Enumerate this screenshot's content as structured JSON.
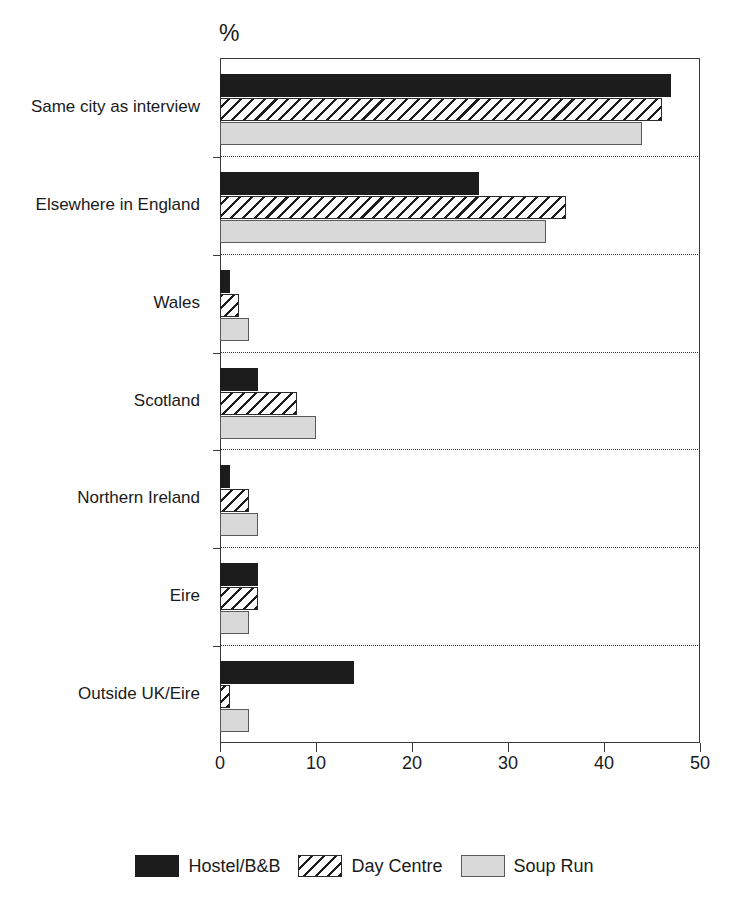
{
  "chart_data": {
    "type": "bar",
    "orientation": "horizontal",
    "title": "",
    "subtitle": "",
    "xlabel": "%",
    "ylabel": "",
    "xlim": [
      0,
      50
    ],
    "xticks": [
      0,
      10,
      20,
      30,
      40,
      50
    ],
    "xtick_labels": [
      "0",
      "10",
      "20",
      "30",
      "40",
      "50"
    ],
    "grid": false,
    "group_separators": "dotted",
    "legend_position": "bottom-center",
    "categories": [
      "Same city as interview",
      "Elsewhere in England",
      "Wales",
      "Scotland",
      "Northern Ireland",
      "Eire",
      "Outside UK/Eire"
    ],
    "series": [
      {
        "name": "Hostel/B&B",
        "key": "hostel",
        "fill": "solid-black",
        "color": "#1c1c1c",
        "values": [
          47,
          27,
          1,
          4,
          1,
          4,
          14
        ]
      },
      {
        "name": "Day Centre",
        "key": "daycentre",
        "fill": "diagonal-hatch",
        "color": "#ffffff",
        "values": [
          46,
          36,
          2,
          8,
          3,
          4,
          1
        ]
      },
      {
        "name": "Soup Run",
        "key": "souprun",
        "fill": "light-gray",
        "color": "#d9d9d9",
        "values": [
          44,
          34,
          3,
          10,
          4,
          3,
          3
        ]
      }
    ]
  },
  "axis": {
    "unit_label": "%"
  },
  "legend": {
    "items": [
      {
        "label": "Hostel/B&B",
        "key": "hostel"
      },
      {
        "label": "Day Centre",
        "key": "daycentre"
      },
      {
        "label": "Soup Run",
        "key": "souprun"
      }
    ]
  }
}
